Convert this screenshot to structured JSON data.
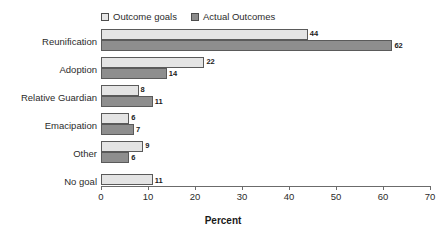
{
  "chart_data": {
    "type": "bar",
    "orientation": "horizontal",
    "title": "",
    "xlabel": "Percent",
    "ylabel": "",
    "xlim": [
      0,
      70
    ],
    "xticks": [
      "0",
      "10",
      "20",
      "30",
      "40",
      "50",
      "60",
      "70"
    ],
    "grid": false,
    "legend_position": "top-left",
    "categories": [
      "Reunification",
      "Adoption",
      "Relative Guardian",
      "Emacipation",
      "Other",
      "No goal"
    ],
    "series": [
      {
        "name": "Outcome goals",
        "color": "#e4e4e4",
        "values": [
          44,
          22,
          8,
          6,
          9,
          11
        ],
        "labels": [
          "44",
          "22",
          "8",
          "6",
          "9",
          "11"
        ]
      },
      {
        "name": "Actual Outcomes",
        "color": "#8e8e8e",
        "values": [
          62,
          14,
          11,
          7,
          6,
          null
        ],
        "labels": [
          "62",
          "14",
          "11",
          "7",
          "6",
          ""
        ]
      }
    ]
  },
  "legend": {
    "items": [
      {
        "label": "Outcome goals",
        "swatch": "light-swatch-icon"
      },
      {
        "label": "Actual Outcomes",
        "swatch": "dark-swatch-icon"
      }
    ]
  },
  "axis": {
    "title": "Percent",
    "ticks": [
      "0",
      "10",
      "20",
      "30",
      "40",
      "50",
      "60",
      "70"
    ]
  },
  "colors": {
    "outcome_goals": "#e4e4e4",
    "actual_outcomes": "#8e8e8e",
    "border": "#5a5a5a",
    "axis": "#6b6b6b",
    "text": "#2b2b2b"
  }
}
